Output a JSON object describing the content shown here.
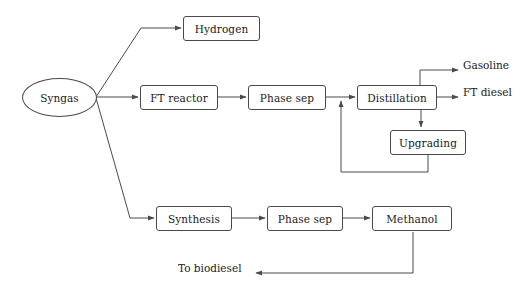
{
  "diagram": {
    "type": "process-flow-diagram",
    "background_color": "#ffffff",
    "line_color": "#4a4a4a",
    "text_color": "#1a1a1a",
    "nodes": [
      {
        "id": "syngas",
        "label": "Syngas",
        "shape": "ellipse",
        "x": 22,
        "y": 78,
        "w": 75,
        "h": 39
      },
      {
        "id": "hydrogen",
        "label": "Hydrogen",
        "shape": "box",
        "x": 183,
        "y": 16,
        "w": 77,
        "h": 25
      },
      {
        "id": "ft_reactor",
        "label": "FT reactor",
        "shape": "box",
        "x": 140,
        "y": 85,
        "w": 78,
        "h": 25
      },
      {
        "id": "phase_sep_1",
        "label": "Phase sep",
        "shape": "box",
        "x": 248,
        "y": 85,
        "w": 78,
        "h": 25
      },
      {
        "id": "distillation",
        "label": "Distillation",
        "shape": "box",
        "x": 357,
        "y": 85,
        "w": 80,
        "h": 25
      },
      {
        "id": "upgrading",
        "label": "Upgrading",
        "shape": "box",
        "x": 390,
        "y": 130,
        "w": 76,
        "h": 25
      },
      {
        "id": "synthesis",
        "label": "Synthesis",
        "shape": "box",
        "x": 156,
        "y": 206,
        "w": 76,
        "h": 25
      },
      {
        "id": "phase_sep_2",
        "label": "Phase sep",
        "shape": "box",
        "x": 267,
        "y": 206,
        "w": 76,
        "h": 25
      },
      {
        "id": "methanol",
        "label": "Methanol",
        "shape": "box",
        "x": 372,
        "y": 206,
        "w": 80,
        "h": 25
      }
    ],
    "labels": [
      {
        "id": "gasoline",
        "text": "Gasoline",
        "x": 463,
        "y": 65
      },
      {
        "id": "ft_diesel",
        "text": "FT diesel",
        "x": 463,
        "y": 92
      },
      {
        "id": "to_biodiesel",
        "text": "To biodiesel",
        "x": 178,
        "y": 268
      }
    ],
    "edges": [
      {
        "id": "syngas-to-hydrogen",
        "from": "syngas",
        "to": "hydrogen"
      },
      {
        "id": "syngas-to-ft-reactor",
        "from": "syngas",
        "to": "ft_reactor"
      },
      {
        "id": "syngas-to-synthesis",
        "from": "syngas",
        "to": "synthesis"
      },
      {
        "id": "ft-reactor-to-phase-sep",
        "from": "ft_reactor",
        "to": "phase_sep_1"
      },
      {
        "id": "phase-sep-to-distillation",
        "from": "phase_sep_1",
        "to": "distillation"
      },
      {
        "id": "distillation-to-gasoline",
        "from": "distillation",
        "to": "gasoline"
      },
      {
        "id": "distillation-to-ft-diesel",
        "from": "distillation",
        "to": "ft_diesel"
      },
      {
        "id": "distillation-to-upgrading",
        "from": "distillation",
        "to": "upgrading"
      },
      {
        "id": "upgrading-recycle",
        "from": "upgrading",
        "to": "distillation"
      },
      {
        "id": "synthesis-to-phase-sep",
        "from": "synthesis",
        "to": "phase_sep_2"
      },
      {
        "id": "phase-sep-to-methanol",
        "from": "phase_sep_2",
        "to": "methanol"
      },
      {
        "id": "methanol-to-biodiesel",
        "from": "methanol",
        "to": "to_biodiesel"
      }
    ]
  }
}
